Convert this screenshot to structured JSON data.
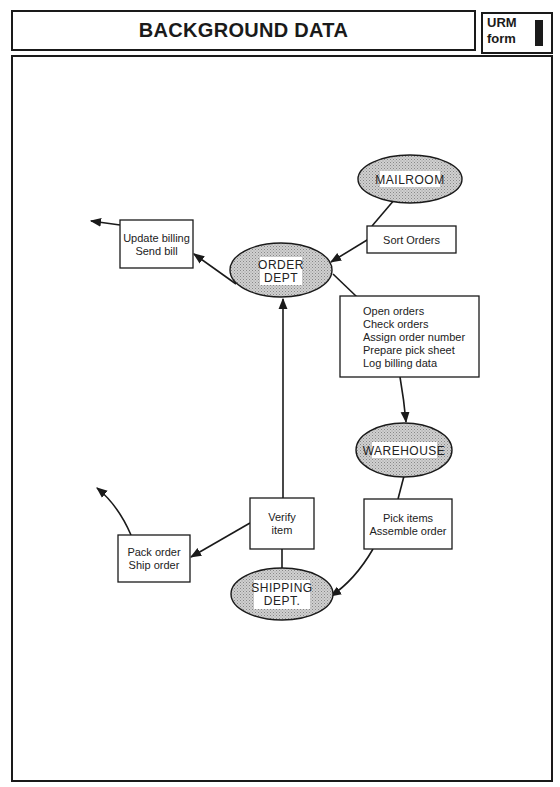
{
  "header": {
    "title": "BACKGROUND DATA",
    "form_label_line1": "URM",
    "form_label_line2": "form",
    "form_number": "I"
  },
  "diagram": {
    "departments": {
      "mailroom": "MAILROOM",
      "order_dept_line1": "ORDER",
      "order_dept_line2": "DEPT",
      "warehouse": "WAREHOUSE",
      "shipping_line1": "SHIPPING",
      "shipping_line2": "DEPT."
    },
    "activities": {
      "sort_orders": [
        "Sort Orders"
      ],
      "order_processing": [
        "Open orders",
        "Check orders",
        "Assign order number",
        "Prepare pick sheet",
        "Log billing data"
      ],
      "billing": [
        "Update billing",
        "Send bill"
      ],
      "picking": [
        "Pick items",
        "Assemble order"
      ],
      "verify": [
        "Verify",
        "item"
      ],
      "shipping": [
        "Pack order",
        "Ship order"
      ]
    },
    "colors": {
      "line": "#1a1a1a",
      "ellipse_fill": "#c8c8c8",
      "label_bg": "#ffffff"
    }
  }
}
